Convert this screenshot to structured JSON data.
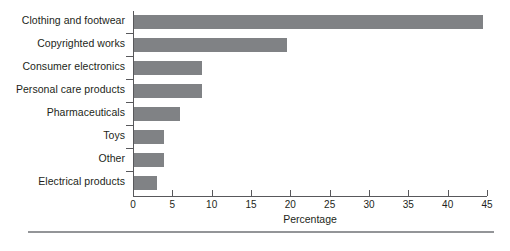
{
  "chart_data": {
    "type": "bar",
    "orientation": "horizontal",
    "title": "",
    "xlabel": "Percentage",
    "ylabel": "",
    "xlim": [
      0,
      45
    ],
    "xticks": [
      0,
      5,
      10,
      15,
      20,
      25,
      30,
      35,
      40,
      45
    ],
    "grid": false,
    "legend": null,
    "bar_color": "#808285",
    "axis_color": "#58585b",
    "categories": [
      "Clothing and footwear",
      "Copyrighted works",
      "Consumer electronics",
      "Personal care products",
      "Pharmaceuticals",
      "Toys",
      "Other",
      "Electrical products"
    ],
    "values": [
      44.4,
      19.4,
      8.6,
      8.6,
      5.8,
      3.8,
      3.8,
      2.9
    ]
  },
  "figure": {
    "caption": ""
  }
}
